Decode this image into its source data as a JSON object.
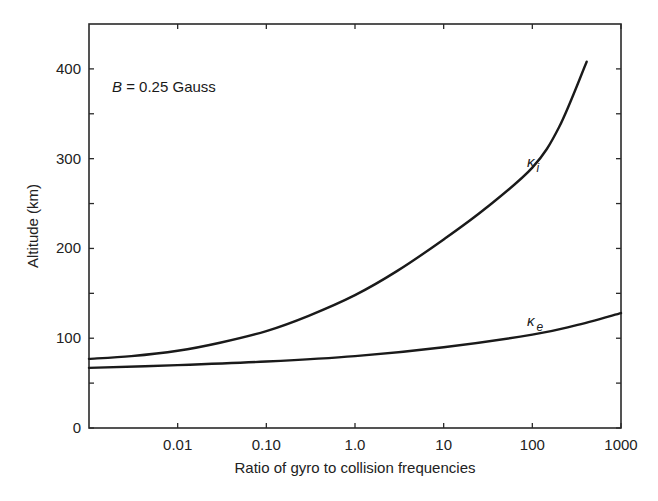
{
  "chart_data": {
    "type": "line",
    "title": "",
    "xlabel": "Ratio of gyro to collision frequencies",
    "ylabel": "Altitude (km)",
    "xscale": "log",
    "xlim": [
      0.001,
      1000
    ],
    "ylim": [
      0,
      450
    ],
    "x_ticks": [
      0.01,
      0.1,
      1,
      10,
      100,
      1000
    ],
    "x_tick_labels": [
      "0.01",
      "0.10",
      "1.0",
      "10",
      "100",
      "1000"
    ],
    "y_ticks": [
      0,
      100,
      200,
      300,
      400
    ],
    "y_tick_labels": [
      "0",
      "100",
      "200",
      "300",
      "400"
    ],
    "y_minor_ticks": [
      50,
      150,
      250,
      350
    ],
    "grid": false,
    "annotation": {
      "var": "B",
      "text": " = 0.25 Gauss"
    },
    "series": [
      {
        "name": "κi",
        "label_main": "κ",
        "label_sub": "i",
        "x": [
          0.001,
          0.003,
          0.01,
          0.03,
          0.1,
          0.3,
          1,
          3,
          10,
          30,
          100,
          200,
          410
        ],
        "y": [
          77,
          80,
          86,
          95,
          108,
          125,
          148,
          175,
          210,
          245,
          290,
          335,
          408
        ]
      },
      {
        "name": "κe",
        "label_main": "κ",
        "label_sub": "e",
        "x": [
          0.001,
          0.01,
          0.1,
          1,
          10,
          100,
          300,
          1000
        ],
        "y": [
          67,
          70,
          74,
          80,
          90,
          104,
          114,
          128
        ]
      }
    ]
  }
}
